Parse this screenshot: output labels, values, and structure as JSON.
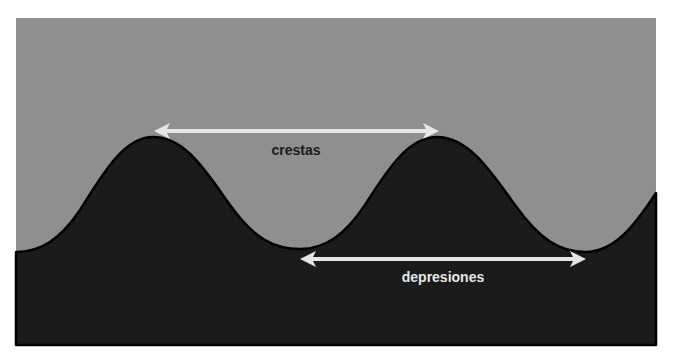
{
  "diagram": {
    "type": "wave-profile",
    "colors": {
      "background": "#ffffff",
      "sky": "#8f8f8f",
      "ground": "#1b1b1b",
      "outline": "#000000",
      "arrow": "#e6e6e6",
      "label_on_sky": "#1b1b1b",
      "label_on_ground": "#e6e6e6"
    },
    "labels": {
      "crests": "crestas",
      "troughs": "depresiones"
    },
    "arrows": [
      {
        "name": "crest-to-crest",
        "label": "crestas"
      },
      {
        "name": "trough-to-trough",
        "label": "depresiones"
      }
    ]
  }
}
